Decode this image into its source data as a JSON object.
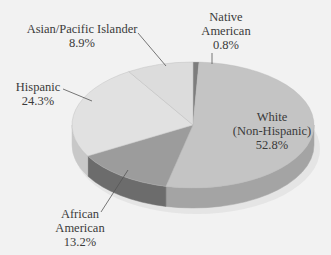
{
  "chart_data": {
    "type": "pie",
    "style": "3d-pie",
    "title": "",
    "slices": [
      {
        "label": "Native American",
        "value": 0.8,
        "display": "0.8%",
        "color": "#7d7d7d",
        "side_color": "#5e5e5e"
      },
      {
        "label": "White (Non-Hispanic)",
        "value": 52.8,
        "display": "52.8%",
        "color": "#c4c4c4",
        "side_color": "#a4a4a4"
      },
      {
        "label": "African American",
        "value": 13.2,
        "display": "13.2%",
        "color": "#9c9c9c",
        "side_color": "#6c6c6c"
      },
      {
        "label": "Hispanic",
        "value": 24.3,
        "display": "24.3%",
        "color": "#e1e1e1",
        "side_color": "#c8c8c8"
      },
      {
        "label": "Asian/Pacific Islander",
        "value": 8.9,
        "display": "8.9%",
        "color": "#dcdcdc",
        "side_color": "#c2c2c2"
      }
    ],
    "start_angle_deg": -90,
    "direction": "clockwise",
    "legend": "none (leader-line labels)"
  },
  "labels": {
    "native": {
      "line1": "Native",
      "line2": "American",
      "line3": "0.8%"
    },
    "white": {
      "line1": "White",
      "line2": "(Non-Hispanic)",
      "line3": "52.8%"
    },
    "african": {
      "line1": "African",
      "line2": "American",
      "line3": "13.2%"
    },
    "hispanic": {
      "line1": "Hispanic",
      "line2": "24.3%"
    },
    "asian": {
      "line1": "Asian/Pacific Islander",
      "line2": "8.9%"
    }
  },
  "colors": {
    "background": "#f2f2f2",
    "label_text": "#3a3a3a",
    "leader_line": "#555555"
  }
}
